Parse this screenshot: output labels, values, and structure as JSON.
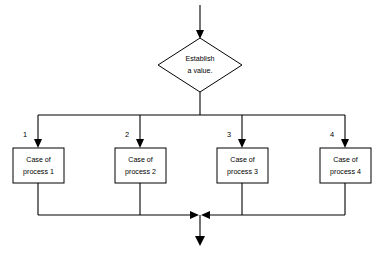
{
  "diagram": {
    "background_color": "#ffffff",
    "line_color": "#000000",
    "shape_fill": "#ffffff",
    "decision": {
      "shape": "diamond",
      "line_1": "Establish",
      "line_2": "a value."
    },
    "branch_labels": [
      {
        "label": "1"
      },
      {
        "label": "2"
      },
      {
        "label": "3"
      },
      {
        "label": "4"
      }
    ],
    "process_boxes": [
      {
        "line_1": "Case of",
        "line_2": "process 1"
      },
      {
        "line_1": "Case of",
        "line_2": "process 2"
      },
      {
        "line_1": "Case of",
        "line_2": "process 3"
      },
      {
        "line_1": "Case of",
        "line_2": "process 4"
      }
    ],
    "connectors": {
      "entry_arrow": "arrow-down-into-decision",
      "distribution_bar": "horizontal-split-bar",
      "merge_bar": "horizontal-merge-bar",
      "exit_arrow": "arrow-down-out-of-merge"
    }
  }
}
